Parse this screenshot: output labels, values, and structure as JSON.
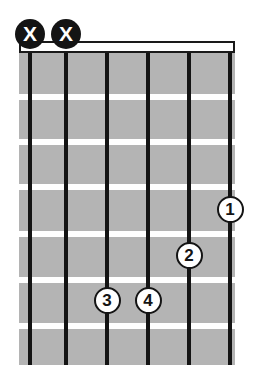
{
  "diagram": {
    "type": "guitar-chord-diagram",
    "instrument": "guitar",
    "string_count": 6,
    "fret_count": 6,
    "colors": {
      "background": "#ffffff",
      "fretboard": "#b4b4b4",
      "string": "#141414",
      "fret": "#ffffff",
      "nut_fill": "#ffffff",
      "nut_border": "#1a1a1a",
      "mute_marker_fill": "#141414",
      "mute_marker_text": "#ffffff",
      "finger_marker_fill": "#ffffff",
      "finger_marker_border": "#141414",
      "finger_marker_text": "#141414"
    },
    "board": {
      "left": 19,
      "top": 52,
      "width": 216,
      "height": 313
    },
    "nut": {
      "left": 19,
      "top": 41,
      "width": 216,
      "height": 12
    },
    "strings": [
      {
        "index": 1,
        "x": 30
      },
      {
        "index": 2,
        "x": 66
      },
      {
        "index": 3,
        "x": 107
      },
      {
        "index": 4,
        "x": 148
      },
      {
        "index": 5,
        "x": 189
      },
      {
        "index": 6,
        "x": 230
      }
    ],
    "frets": [
      {
        "index": 1,
        "y": 94
      },
      {
        "index": 2,
        "y": 139
      },
      {
        "index": 3,
        "y": 184
      },
      {
        "index": 4,
        "y": 231
      },
      {
        "index": 5,
        "y": 277
      },
      {
        "index": 6,
        "y": 323
      }
    ],
    "mute_markers": [
      {
        "label": "X",
        "string": 1,
        "x": 30,
        "y": 34
      },
      {
        "label": "X",
        "string": 2,
        "x": 66,
        "y": 34
      }
    ],
    "finger_markers": [
      {
        "label": "1",
        "string": 6,
        "fret": 5,
        "x": 230,
        "y": 209
      },
      {
        "label": "2",
        "string": 5,
        "fret": 6,
        "x": 189,
        "y": 255
      },
      {
        "label": "3",
        "string": 3,
        "fret": 7,
        "x": 107,
        "y": 300
      },
      {
        "label": "4",
        "string": 4,
        "fret": 7,
        "x": 148,
        "y": 300
      }
    ]
  }
}
